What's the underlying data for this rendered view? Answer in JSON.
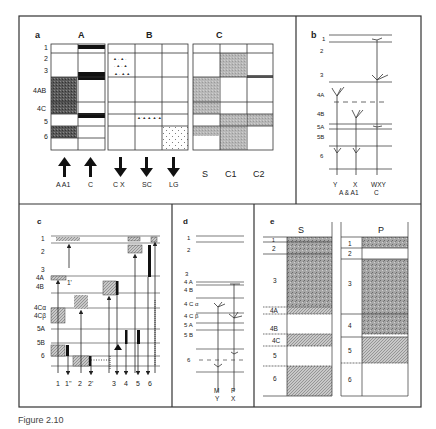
{
  "figure": {
    "caption": "Figure 2.10"
  },
  "panel_a": {
    "label": "a",
    "groups": [
      "A",
      "B",
      "C"
    ],
    "rows": [
      "1",
      "2",
      "3",
      "4AB",
      "4C",
      "5",
      "6"
    ],
    "bottom_labels": {
      "A_cols": [
        "A A1",
        "C"
      ],
      "B_cols": [
        "C X",
        "SC",
        "LG"
      ],
      "C_cols": [
        "S",
        "C1",
        "C2"
      ]
    },
    "arrow_directions": {
      "A": "up",
      "B": "down"
    }
  },
  "panel_b": {
    "label": "b",
    "layers": [
      "1",
      "2",
      "3",
      "4A",
      "4B",
      "5A",
      "5B",
      "6"
    ],
    "cells": [
      {
        "name": "Y",
        "type": "A & A1"
      },
      {
        "name": "X",
        "type": "A & A1"
      },
      {
        "name": "WXY",
        "type": "C"
      }
    ],
    "bottom_line1": "Y   X   WXY",
    "bottom_line2": "A& A1   C"
  },
  "panel_c": {
    "label": "c",
    "layers": [
      "1",
      "2",
      "3",
      "4A",
      "4B",
      "4Cα",
      "4Cβ",
      "5A",
      "5B",
      "6"
    ],
    "column_labels": [
      "1",
      "1''",
      "2",
      "2'",
      "3",
      "4",
      "5",
      "6"
    ],
    "annotation": "1'"
  },
  "panel_d": {
    "label": "d",
    "layers": [
      "1",
      "2",
      "3",
      "4 A",
      "4 B",
      "4 C α",
      "4 C β",
      "5 A",
      "5 B",
      "6"
    ],
    "cells": [
      {
        "top": "M",
        "bottom": "Y"
      },
      {
        "top": "P",
        "bottom": "X"
      }
    ]
  },
  "panel_e": {
    "label": "e",
    "columns": [
      {
        "title": "S",
        "layers": [
          "1",
          "2",
          "3",
          "4A",
          "4B",
          "4C",
          "5",
          "6"
        ]
      },
      {
        "title": "P",
        "layers": [
          "1",
          "2",
          "3",
          "4",
          "5",
          "6"
        ]
      }
    ]
  }
}
